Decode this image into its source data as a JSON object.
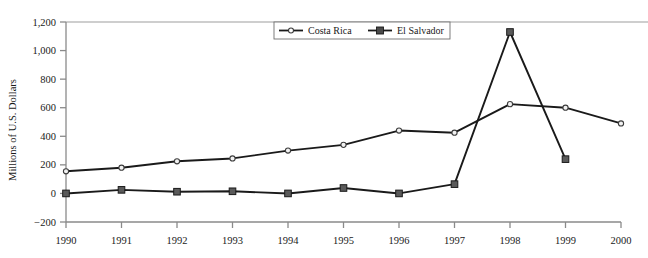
{
  "chart_data": {
    "type": "line",
    "title": "",
    "subtitle": "",
    "xlabel": "",
    "ylabel": "Millions of U.S. Dollars",
    "categories": [
      "1990",
      "1991",
      "1992",
      "1993",
      "1994",
      "1995",
      "1996",
      "1997",
      "1998",
      "1999",
      "2000"
    ],
    "x": [
      1990,
      1991,
      1992,
      1993,
      1994,
      1995,
      1996,
      1997,
      1998,
      1999,
      2000
    ],
    "xlim": [
      1990,
      2000
    ],
    "ylim": [
      -200,
      1200
    ],
    "yticks": [
      -200,
      0,
      200,
      400,
      600,
      800,
      1000,
      1200
    ],
    "ytick_labels": [
      "−200",
      "0",
      "200",
      "400",
      "600",
      "800",
      "1,000",
      "1,200"
    ],
    "grid": false,
    "legend_position": "top-center",
    "series": [
      {
        "name": "Costa Rica",
        "marker": "open-circle",
        "color": "#1a1a1a",
        "values": [
          155,
          180,
          225,
          245,
          300,
          340,
          440,
          425,
          625,
          600,
          490
        ]
      },
      {
        "name": "El Salvador",
        "marker": "filled-square",
        "color": "#1a1a1a",
        "values": [
          0,
          25,
          12,
          15,
          0,
          38,
          0,
          65,
          1130,
          240,
          null
        ]
      }
    ]
  },
  "legend": {
    "items": [
      {
        "label": "Costa Rica",
        "marker": "open-circle"
      },
      {
        "label": "El Salvador",
        "marker": "filled-square"
      }
    ]
  },
  "colors": {
    "series_line": "#1a1a1a",
    "axis": "#8a8a8a",
    "top_rule": "#9e9e9e",
    "text": "#1a1a1a",
    "marker_fill": "#5a5a5a",
    "background": "#ffffff"
  }
}
